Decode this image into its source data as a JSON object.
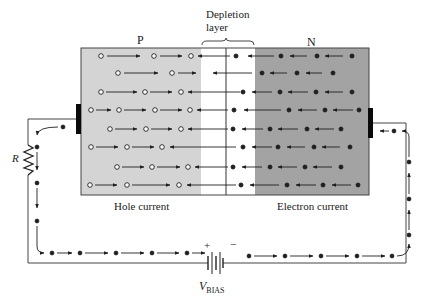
{
  "diagram": {
    "labels": {
      "p_region": "P",
      "n_region": "N",
      "depletion_line1": "Depletion",
      "depletion_line2": "layer",
      "hole_current": "Hole current",
      "electron_current": "Electron current",
      "resistor": "R",
      "battery_plus": "+",
      "battery_minus": "−",
      "vbias_main": "V",
      "vbias_sub": "BIAS"
    },
    "colors": {
      "p_region": "#d4d4d4",
      "n_region": "#a3a3a3",
      "depletion": "#ffffff",
      "ink": "#1f1f1f",
      "wire": "#333333",
      "electrode": "#0a0a0a"
    },
    "legend": {
      "hole_symbol": "open circle (hole) moving right",
      "electron_symbol": "filled dot (electron) moving left"
    }
  }
}
